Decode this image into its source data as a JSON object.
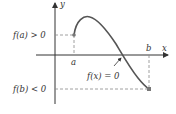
{
  "diagram": {
    "labels": {
      "y_axis": "y",
      "x_axis": "x",
      "a": "a",
      "b": "b",
      "fa": "f(a) > 0",
      "fb": "f(b) < 0",
      "zero": "f(x) = 0"
    },
    "colors": {
      "curve": "#555555",
      "axis": "#333333",
      "dashed": "#888888",
      "point": "#777777"
    }
  }
}
